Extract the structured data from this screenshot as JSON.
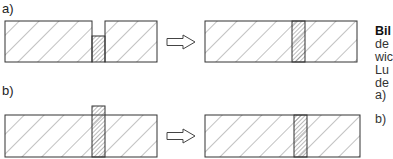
{
  "figure": {
    "labels": {
      "a": "a)",
      "b": "b)"
    },
    "caption_fragment": {
      "title": "Bil",
      "lines": [
        "de",
        "wic",
        "Lu",
        "de"
      ],
      "items": [
        "a)",
        "b)"
      ]
    },
    "colors": {
      "stroke": "#333333",
      "hatch": "#555555",
      "background": "#ffffff"
    },
    "rows": [
      {
        "id": "a",
        "before": {
          "left_block": [
            5,
            21,
            87,
            41
          ],
          "insert": [
            92,
            36,
            13,
            26
          ],
          "right_block": [
            105,
            21,
            52,
            41
          ]
        },
        "arrow": [
          167,
          36,
          28,
          12
        ],
        "after": {
          "block": [
            205,
            21,
            152,
            41
          ],
          "insert": [
            292,
            21,
            13,
            41
          ]
        }
      },
      {
        "id": "b",
        "before": {
          "block": [
            5,
            115,
            152,
            42
          ],
          "insert": [
            92,
            106,
            13,
            51
          ]
        },
        "arrow": [
          167,
          130,
          28,
          12
        ],
        "after": {
          "block": [
            205,
            115,
            155,
            42
          ],
          "insert": [
            294,
            115,
            13,
            42
          ]
        }
      }
    ]
  }
}
